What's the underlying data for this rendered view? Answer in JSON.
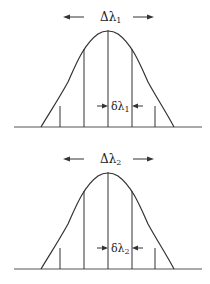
{
  "panels": [
    {
      "id": "panel-1",
      "width_label": "Δλ",
      "width_subscript": "1",
      "spacing_label": "δλ",
      "spacing_subscript": "1",
      "offset_y": 0
    },
    {
      "id": "panel-2",
      "width_label": "Δλ",
      "width_subscript": "2",
      "spacing_label": "δλ",
      "spacing_subscript": "2",
      "offset_y": 142
    }
  ],
  "colors": {
    "line": "#333333",
    "baseline": "#555555",
    "text": "#222222"
  }
}
